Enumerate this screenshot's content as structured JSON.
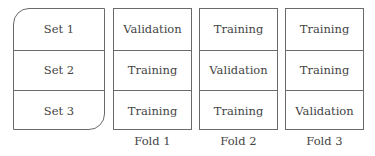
{
  "sets": {
    "rows": [
      "Set 1",
      "Set 2",
      "Set 3"
    ]
  },
  "folds": [
    {
      "label": "Fold 1",
      "rows": [
        "Validation",
        "Training",
        "Training"
      ]
    },
    {
      "label": "Fold 2",
      "rows": [
        "Training",
        "Validation",
        "Training"
      ]
    },
    {
      "label": "Fold 3",
      "rows": [
        "Training",
        "Training",
        "Validation"
      ]
    }
  ],
  "colors": {
    "border": "#6a6a6a",
    "text": "#444444",
    "background": "#ffffff"
  }
}
